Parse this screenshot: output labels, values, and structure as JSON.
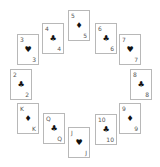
{
  "game": {
    "layout": "clock-circle",
    "cards": [
      {
        "rank": "5",
        "suit": "♦",
        "suit_name": "diamonds",
        "x": 68,
        "y": 10
      },
      {
        "rank": "6",
        "suit": "♣",
        "suit_name": "clubs",
        "x": 95,
        "y": 23
      },
      {
        "rank": "7",
        "suit": "♥",
        "suit_name": "hearts",
        "x": 119,
        "y": 34
      },
      {
        "rank": "8",
        "suit": "♣",
        "suit_name": "clubs",
        "x": 130,
        "y": 69
      },
      {
        "rank": "9",
        "suit": "♦",
        "suit_name": "diamonds",
        "x": 119,
        "y": 103
      },
      {
        "rank": "10",
        "suit": "♣",
        "suit_name": "clubs",
        "x": 95,
        "y": 114
      },
      {
        "rank": "J",
        "suit": "♥",
        "suit_name": "hearts",
        "x": 68,
        "y": 127
      },
      {
        "rank": "Q",
        "suit": "♣",
        "suit_name": "clubs",
        "x": 43,
        "y": 113
      },
      {
        "rank": "K",
        "suit": "♦",
        "suit_name": "diamonds",
        "x": 17,
        "y": 103
      },
      {
        "rank": "2",
        "suit": "♣",
        "suit_name": "clubs",
        "x": 10,
        "y": 69
      },
      {
        "rank": "3",
        "suit": "♥",
        "suit_name": "hearts",
        "x": 17,
        "y": 34
      },
      {
        "rank": "4",
        "suit": "♣",
        "suit_name": "clubs",
        "x": 42,
        "y": 23
      }
    ]
  }
}
